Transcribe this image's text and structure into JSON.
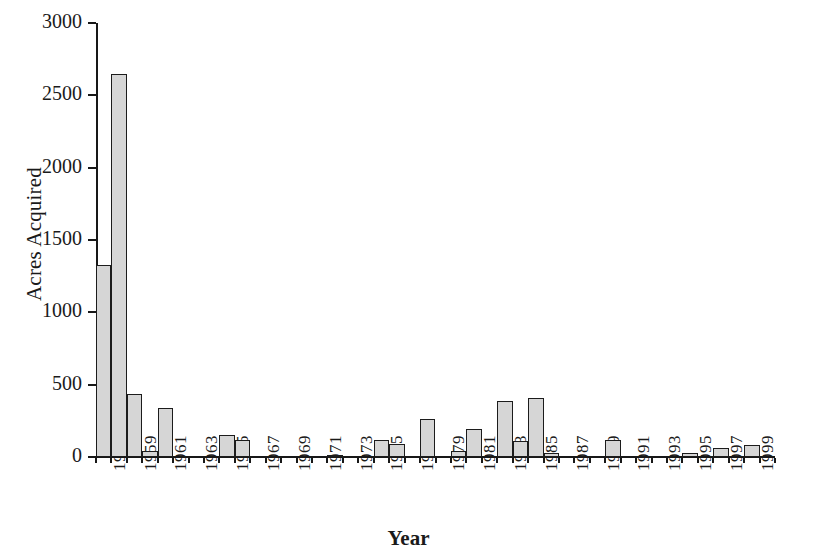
{
  "chart_data": {
    "type": "bar",
    "title": "",
    "subtitle": "",
    "xlabel": "Year",
    "ylabel": "Acres Acquired",
    "xlim": [
      1957,
      2001
    ],
    "ylim": [
      0,
      3000
    ],
    "y_ticks": [
      0,
      500,
      1000,
      1500,
      2000,
      2500,
      3000
    ],
    "y_tick_labels": [
      "0",
      "500",
      "1000",
      "1500",
      "2000",
      "2500",
      "3000"
    ],
    "x_tick_labels": [
      "1957",
      "1959",
      "1961",
      "1963",
      "1965",
      "1967",
      "1969",
      "1971",
      "1973",
      "1975",
      "1977",
      "1979",
      "1981",
      "1983",
      "1985",
      "1987",
      "1989",
      "1991",
      "1993",
      "1995",
      "1997",
      "1999"
    ],
    "grid": false,
    "legend": null,
    "bar_fill_color": "#d6d6d6",
    "bar_edge_color": "#1c1c1c",
    "axis_color": "#181818",
    "categories": [
      1957,
      1958,
      1959,
      1960,
      1961,
      1962,
      1963,
      1964,
      1965,
      1966,
      1967,
      1968,
      1969,
      1970,
      1971,
      1972,
      1973,
      1974,
      1975,
      1976,
      1977,
      1978,
      1979,
      1980,
      1981,
      1982,
      1983,
      1984,
      1985,
      1986,
      1987,
      1988,
      1989,
      1990,
      1991,
      1992,
      1993,
      1994,
      1995,
      1996,
      1997,
      1998,
      1999,
      2000
    ],
    "values": [
      1330,
      2650,
      435,
      40,
      340,
      0,
      0,
      0,
      150,
      115,
      0,
      0,
      0,
      0,
      0,
      15,
      0,
      0,
      120,
      90,
      0,
      260,
      0,
      40,
      195,
      0,
      390,
      110,
      410,
      30,
      0,
      0,
      0,
      120,
      0,
      0,
      0,
      0,
      30,
      0,
      65,
      0,
      85,
      0
    ]
  }
}
